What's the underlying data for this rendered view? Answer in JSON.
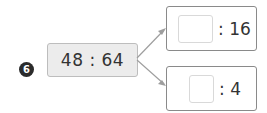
{
  "problem": {
    "number": "6",
    "ratio": "48 : 64",
    "branches": [
      {
        "blank_value": "",
        "term": ": 16"
      },
      {
        "blank_value": "",
        "term": ": 4"
      }
    ]
  }
}
